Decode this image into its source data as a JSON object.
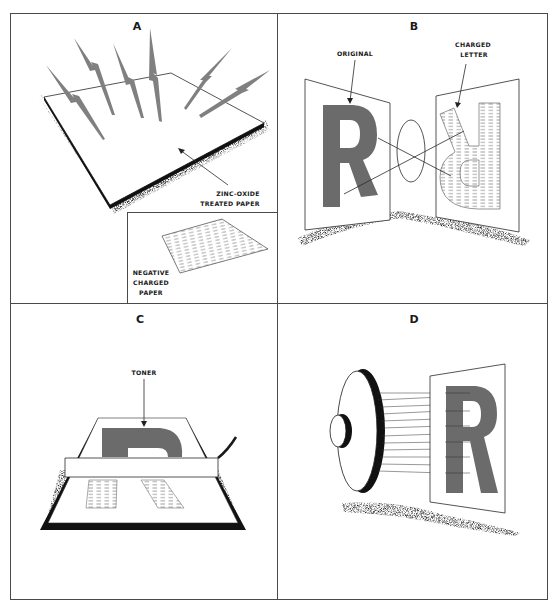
{
  "figure": {
    "colors": {
      "background": "#ffffff",
      "frame": "#4a4a4a",
      "letter_gray": "#6b6b6b",
      "bolt_gray": "#808080",
      "shadow": "#1a1a1a"
    },
    "panels": [
      {
        "id": "A",
        "letter": "A",
        "labels": {
          "main_line1": "ZINC-OXIDE",
          "main_line2": "TREATED PAPER",
          "inset_line1": "NEGATIVE",
          "inset_line2": "CHARGED",
          "inset_line3": "PAPER"
        }
      },
      {
        "id": "B",
        "letter": "B",
        "labels": {
          "original": "ORIGINAL",
          "charged_line1": "CHARGED",
          "charged_line2": "LETTER"
        },
        "letter_glyph": "R"
      },
      {
        "id": "C",
        "letter": "C",
        "labels": {
          "toner": "TONER"
        },
        "letter_glyph": "R"
      },
      {
        "id": "D",
        "letter": "D",
        "letter_glyph": "R"
      }
    ]
  }
}
